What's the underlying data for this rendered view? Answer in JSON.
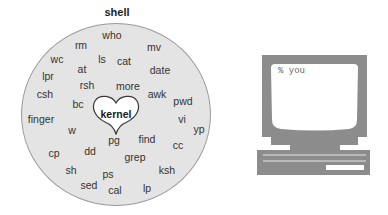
{
  "diagram": {
    "title": "shell",
    "center_label": "kernel",
    "commands": [
      {
        "text": "who",
        "x": 112,
        "y": 35
      },
      {
        "text": "rm",
        "x": 81,
        "y": 45
      },
      {
        "text": "mv",
        "x": 154,
        "y": 47
      },
      {
        "text": "wc",
        "x": 57,
        "y": 59
      },
      {
        "text": "ls",
        "x": 102,
        "y": 59
      },
      {
        "text": "cat",
        "x": 124,
        "y": 61
      },
      {
        "text": "at",
        "x": 82,
        "y": 69
      },
      {
        "text": "date",
        "x": 160,
        "y": 70
      },
      {
        "text": "lpr",
        "x": 48,
        "y": 76
      },
      {
        "text": "rsh",
        "x": 87,
        "y": 85
      },
      {
        "text": "more",
        "x": 128,
        "y": 86
      },
      {
        "text": "csh",
        "x": 45,
        "y": 94
      },
      {
        "text": "awk",
        "x": 157,
        "y": 94
      },
      {
        "text": "pwd",
        "x": 183,
        "y": 101
      },
      {
        "text": "bc",
        "x": 78,
        "y": 104
      },
      {
        "text": "finger",
        "x": 41,
        "y": 119
      },
      {
        "text": "vi",
        "x": 182,
        "y": 119
      },
      {
        "text": "yp",
        "x": 199,
        "y": 129
      },
      {
        "text": "w",
        "x": 72,
        "y": 130
      },
      {
        "text": "pg",
        "x": 114,
        "y": 140
      },
      {
        "text": "find",
        "x": 147,
        "y": 139
      },
      {
        "text": "cc",
        "x": 178,
        "y": 145
      },
      {
        "text": "cp",
        "x": 54,
        "y": 153
      },
      {
        "text": "dd",
        "x": 90,
        "y": 151
      },
      {
        "text": "grep",
        "x": 135,
        "y": 157
      },
      {
        "text": "sh",
        "x": 71,
        "y": 170
      },
      {
        "text": "ps",
        "x": 108,
        "y": 174
      },
      {
        "text": "ksh",
        "x": 167,
        "y": 170
      },
      {
        "text": "sed",
        "x": 89,
        "y": 185
      },
      {
        "text": "cal",
        "x": 115,
        "y": 190
      },
      {
        "text": "lp",
        "x": 147,
        "y": 188
      }
    ]
  },
  "terminal": {
    "prompt_text": "% you"
  },
  "colors": {
    "circle_fill": "#e4e4e4",
    "circle_stroke": "#9a9a9a",
    "computer_body": "#8c8c8c",
    "screen": "#ffffff"
  }
}
